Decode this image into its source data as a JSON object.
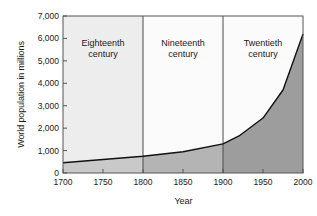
{
  "chart_data": {
    "type": "area",
    "title": "",
    "xlabel": "Year",
    "ylabel": "World population in millions",
    "xlim": [
      1700,
      2000
    ],
    "ylim": [
      0,
      7000
    ],
    "grid": false,
    "legend": "none",
    "xticks": [
      "1700",
      "1750",
      "1800",
      "1850",
      "1900",
      "1950",
      "2000"
    ],
    "xtick_values": [
      1700,
      1750,
      1800,
      1850,
      1900,
      1950,
      2000
    ],
    "yticks": [
      "0",
      "1,000",
      "2,000",
      "3,000",
      "4,000",
      "5,000",
      "6,000",
      "7,000"
    ],
    "ytick_values": [
      0,
      1000,
      2000,
      3000,
      4000,
      5000,
      6000,
      7000
    ],
    "x": [
      1700,
      1750,
      1800,
      1850,
      1900,
      1920,
      1950,
      1975,
      2000
    ],
    "values": [
      460,
      600,
      750,
      950,
      1300,
      1650,
      2450,
      3700,
      6200
    ],
    "series": [
      {
        "name": "World population",
        "values": [
          460,
          600,
          750,
          950,
          1300,
          1650,
          2450,
          3700,
          6200
        ]
      }
    ],
    "annotations": [
      {
        "label": "Eighteenth century",
        "line1": "Eighteenth",
        "line2": "century",
        "x_start": 1700,
        "x_end": 1800
      },
      {
        "label": "Nineteenth century",
        "line1": "Nineteenth",
        "line2": "century",
        "x_start": 1800,
        "x_end": 1900
      },
      {
        "label": "Twentieth century",
        "line1": "Twentieth",
        "line2": "century",
        "x_start": 1900,
        "x_end": 2000
      }
    ],
    "dividers": [
      1800,
      1900
    ],
    "colors": {
      "line": "#111111",
      "frame": "#555555",
      "fill_eighteenth": "#c9c9c9",
      "fill_nineteenth": "#b4b4b4",
      "fill_twentieth": "#9d9d9d",
      "panel_eighteenth": "#ededed",
      "panel_nineteenth": "#fbfbfb",
      "panel_twentieth": "#fbfbfb",
      "background": "#ffffff",
      "text": "#1a1a1a"
    }
  }
}
